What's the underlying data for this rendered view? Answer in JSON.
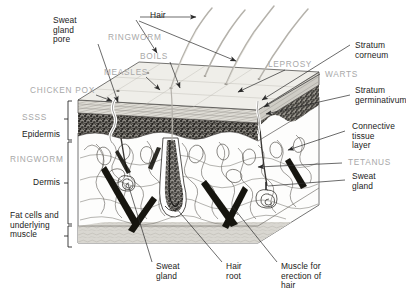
{
  "figure": {
    "type": "anatomical-diagram",
    "colors": {
      "anatomy_label": "#1a1a1a",
      "disease_label": "#a8a8a8",
      "leader_line": "#333333",
      "stratum_corneum_fill": "#e6e4de",
      "stratum_germinativum_fill": "#8d8a84",
      "dermis_fill": "#ffffff",
      "fat_fill": "#d8d6d0",
      "background": "#ffffff"
    }
  },
  "anatomy_labels": {
    "sweat_gland_pore": "Sweat\ngland\npore",
    "hair": "Hair",
    "stratum_corneum": "Stratum\ncorneum",
    "stratum_germinativum": "Stratum\ngerminativum",
    "connective_tissue_layer": "Connective\ntissue\nlayer",
    "sweat_gland_right": "Sweat\ngland",
    "epidermis": "Epidermis",
    "dermis": "Dermis",
    "fat_cells": "Fat cells and\nunderlying\nmuscle",
    "sweat_gland_bottom": "Sweat\ngland",
    "hair_root": "Hair\nroot",
    "muscle_erection": "Muscle for\nerection of\nhair"
  },
  "disease_labels": {
    "ringworm_top": "RINGWORM",
    "boils": "BOILS",
    "measles": "MEASLES",
    "chicken_pox": "CHICKEN POX",
    "ssss": "SSSS",
    "ringworm_left": "RINGWORM",
    "leprosy": "LEPROSY",
    "warts": "WARTS",
    "tetanus": "TETANUS"
  },
  "layers": [
    {
      "name": "Epidermis",
      "sublayers": [
        "Stratum corneum",
        "Stratum germinativum"
      ]
    },
    {
      "name": "Dermis",
      "sublayers": [
        "Connective tissue layer"
      ]
    },
    {
      "name": "Fat cells and underlying muscle",
      "sublayers": []
    }
  ],
  "structures": [
    "Sweat gland pore",
    "Hair",
    "Hair root",
    "Sweat gland",
    "Muscle for erection of hair",
    "Connective tissue layer"
  ]
}
